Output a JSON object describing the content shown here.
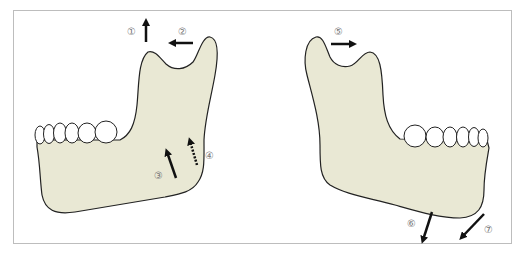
{
  "figure": {
    "colors": {
      "bone_fill": "#e9e8d4",
      "outline": "#222222",
      "arrow": "#111111",
      "frame": "#bdbdbd",
      "label": "#777777"
    },
    "left_view": {
      "labels": [
        {
          "id": "1",
          "text": "①",
          "direction": "up"
        },
        {
          "id": "2",
          "text": "②",
          "direction": "left"
        },
        {
          "id": "3",
          "text": "③",
          "direction": "up-left",
          "style": "solid"
        },
        {
          "id": "4",
          "text": "④",
          "direction": "up-left",
          "style": "dotted"
        }
      ]
    },
    "right_view": {
      "labels": [
        {
          "id": "5",
          "text": "⑤",
          "direction": "right"
        },
        {
          "id": "6",
          "text": "⑥",
          "direction": "down-left"
        },
        {
          "id": "7",
          "text": "⑦",
          "direction": "down-left"
        }
      ]
    }
  }
}
